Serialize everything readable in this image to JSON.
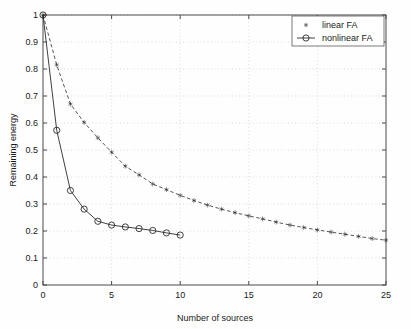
{
  "chart_data": {
    "type": "line",
    "title": "",
    "xlabel": "Number of sources",
    "ylabel": "Remaining energy",
    "xlim": [
      0,
      25
    ],
    "ylim": [
      0,
      1
    ],
    "xticks": [
      0,
      5,
      10,
      15,
      20,
      25
    ],
    "xtick_labels": [
      "0",
      "5",
      "10",
      "15",
      "20",
      "25"
    ],
    "yticks": [
      0,
      0.1,
      0.2,
      0.3,
      0.4,
      0.5,
      0.6,
      0.7,
      0.8,
      0.9,
      1.0
    ],
    "ytick_labels": [
      "0",
      "0.1",
      "0.2",
      "0.3",
      "0.4",
      "0.5",
      "0.6",
      "0.7",
      "0.8",
      "0.9",
      "1"
    ],
    "grid": true,
    "legend_position": "top-right",
    "series": [
      {
        "name": "linear FA",
        "marker": "star",
        "linestyle": "dashed",
        "color": "#1a1a1a",
        "x": [
          0,
          1,
          2,
          3,
          4,
          5,
          6,
          7,
          8,
          9,
          10,
          11,
          12,
          13,
          14,
          15,
          16,
          17,
          18,
          19,
          20,
          21,
          22,
          23,
          24,
          25
        ],
        "values": [
          1.0,
          0.815,
          0.67,
          0.602,
          0.545,
          0.492,
          0.44,
          0.408,
          0.374,
          0.353,
          0.332,
          0.313,
          0.296,
          0.281,
          0.268,
          0.256,
          0.245,
          0.233,
          0.222,
          0.213,
          0.204,
          0.196,
          0.188,
          0.18,
          0.172,
          0.166
        ]
      },
      {
        "name": "nonlinear FA",
        "marker": "circle",
        "linestyle": "solid",
        "color": "#2b2b2b",
        "x": [
          0,
          1,
          2,
          3,
          4,
          5,
          6,
          7,
          8,
          9,
          10
        ],
        "values": [
          1.0,
          0.573,
          0.35,
          0.281,
          0.236,
          0.222,
          0.215,
          0.209,
          0.202,
          0.193,
          0.185
        ]
      }
    ]
  },
  "legend": {
    "entries": [
      {
        "label": "linear FA"
      },
      {
        "label": "nonlinear FA"
      }
    ]
  }
}
